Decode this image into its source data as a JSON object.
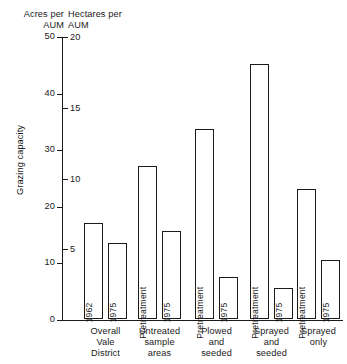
{
  "chart_data": {
    "type": "bar",
    "title": "",
    "ylabel": "Grazing capacity",
    "xlabel": "",
    "grid": false,
    "legend": "none",
    "left_axis": {
      "caption": "Acres per\nAUM",
      "ticks": [
        0,
        10,
        20,
        30,
        40,
        50
      ],
      "ylim": [
        0,
        50
      ],
      "units": "acres per AUM"
    },
    "right_axis": {
      "caption": "Hectares per\nAUM",
      "ticks": [
        0,
        5,
        10,
        15,
        20
      ],
      "ylim": [
        0,
        20
      ],
      "units": "hectares per AUM"
    },
    "categories": [
      "Overall\nVale\nDistrict",
      "Untreated\nsample\nareas",
      "Plowed\nand\nseeded",
      "Sprayed\nand\nseeded",
      "Sprayed\nonly"
    ],
    "bars": [
      {
        "group": "Overall Vale District",
        "label": "1962",
        "value_acres": 17.0,
        "value_hectares": 6.8
      },
      {
        "group": "Overall Vale District",
        "label": "1975",
        "value_acres": 13.5,
        "value_hectares": 5.4
      },
      {
        "group": "Untreated sample areas",
        "label": "Pretreatment",
        "value_acres": 27.0,
        "value_hectares": 10.8
      },
      {
        "group": "Untreated sample areas",
        "label": "1975",
        "value_acres": 15.5,
        "value_hectares": 6.2
      },
      {
        "group": "Plowed and seeded",
        "label": "Pretreatment",
        "value_acres": 33.5,
        "value_hectares": 13.4
      },
      {
        "group": "Plowed and seeded",
        "label": "1975",
        "value_acres": 7.5,
        "value_hectares": 3.0
      },
      {
        "group": "Sprayed and seeded",
        "label": "Pretreatment",
        "value_acres": 45.0,
        "value_hectares": 18.0
      },
      {
        "group": "Sprayed and seeded",
        "label": "1975",
        "value_acres": 5.5,
        "value_hectares": 2.2
      },
      {
        "group": "Sprayed only",
        "label": "Pretreatment",
        "value_acres": 23.0,
        "value_hectares": 9.2
      },
      {
        "group": "Sprayed only",
        "label": "1975",
        "value_acres": 10.5,
        "value_hectares": 4.2
      }
    ],
    "colors": {
      "axis": "#1a1a1a",
      "bar_fill": "#ffffff",
      "bar_stroke": "#1a1a1a",
      "background": "#ffffff"
    }
  }
}
